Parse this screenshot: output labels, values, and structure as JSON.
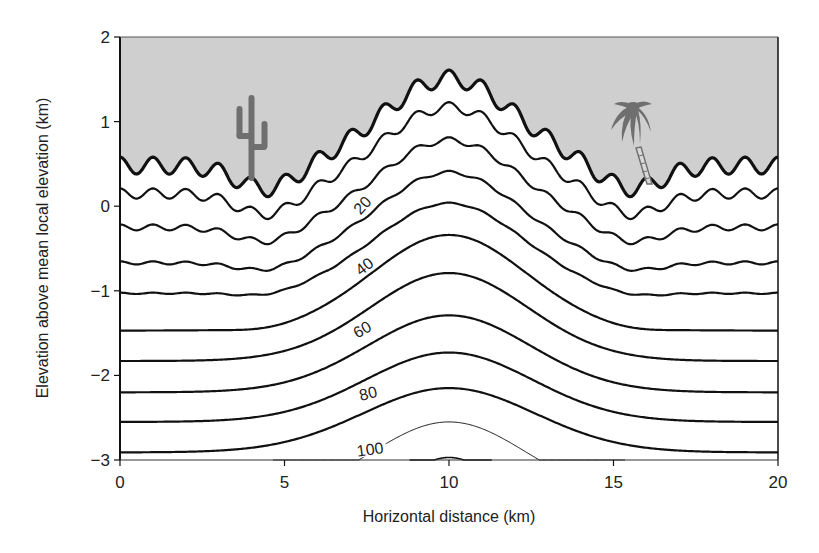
{
  "chart_data": {
    "type": "line",
    "subtype": "contour-cross-section",
    "title": "",
    "xlabel": "Horizontal distance (km)",
    "ylabel": "Elevation above mean local elevation (km)",
    "xlim": [
      0,
      20
    ],
    "ylim": [
      -3,
      2
    ],
    "x_ticks": [
      0,
      5,
      10,
      15,
      20
    ],
    "y_ticks": [
      -3,
      -2,
      -1,
      0,
      1,
      2
    ],
    "grid": false,
    "legend": null,
    "sky_fill": "#cfcfcf",
    "surface": {
      "name": "Ground surface",
      "isotherm": 0,
      "left": 0.48,
      "center": 1.51,
      "sigma": 2.8,
      "dip": 0.29,
      "wave": 0.1,
      "x_range": [
        0,
        20
      ],
      "stroke_width": 3.2,
      "color": "#111111"
    },
    "isotherms": [
      {
        "value": 10,
        "left": 0.15,
        "center": 1.17,
        "sigma": 2.9,
        "dip": 0.27,
        "wave": 0.06,
        "x_range": [
          0,
          20
        ],
        "stroke_width": 2.2,
        "label": ""
      },
      {
        "value": 20,
        "left": -0.25,
        "center": 0.78,
        "sigma": 3.0,
        "dip": 0.2,
        "wave": 0.035,
        "x_range": [
          0,
          20
        ],
        "stroke_width": 2.2,
        "label": "20",
        "label_pos": [
          362,
          205
        ],
        "label_angle": -48
      },
      {
        "value": 30,
        "left": -0.67,
        "center": 0.4,
        "sigma": 3.1,
        "dip": 0.12,
        "wave": 0.018,
        "x_range": [
          0,
          20
        ],
        "stroke_width": 2.2,
        "label": ""
      },
      {
        "value": 40,
        "left": -1.03,
        "center": 0.035,
        "sigma": 3.2,
        "dip": 0.06,
        "wave": 0.008,
        "x_range": [
          0,
          20
        ],
        "stroke_width": 2.2,
        "label": "40",
        "label_pos": [
          364,
          266
        ],
        "label_angle": -38
      },
      {
        "value": 50,
        "left": -1.47,
        "center": -0.34,
        "sigma": 3.3,
        "dip": 0.03,
        "wave": 0.0,
        "x_range": [
          0,
          20
        ],
        "stroke_width": 2.2,
        "label": ""
      },
      {
        "value": 60,
        "left": -1.83,
        "center": -0.79,
        "sigma": 3.4,
        "dip": 0.0,
        "wave": 0.0,
        "x_range": [
          0,
          20
        ],
        "stroke_width": 2.2,
        "label": "60",
        "label_pos": [
          362,
          329
        ],
        "label_angle": -30
      },
      {
        "value": 70,
        "left": -2.2,
        "center": -1.29,
        "sigma": 3.5,
        "dip": 0.0,
        "wave": 0.0,
        "x_range": [
          0,
          20
        ],
        "stroke_width": 2.2,
        "label": ""
      },
      {
        "value": 80,
        "left": -2.55,
        "center": -1.73,
        "sigma": 3.6,
        "dip": 0.0,
        "wave": 0.0,
        "x_range": [
          0,
          20
        ],
        "stroke_width": 2.2,
        "label": "80",
        "label_pos": [
          368,
          393
        ],
        "label_angle": -14
      },
      {
        "value": 90,
        "left": -2.91,
        "center": -2.15,
        "sigma": 3.7,
        "dip": 0.0,
        "wave": 0.0,
        "x_range": [
          0,
          20
        ],
        "stroke_width": 2.2,
        "label": ""
      },
      {
        "value": 100,
        "left": -3.45,
        "center": -2.55,
        "sigma": 3.3,
        "dip": 0.0,
        "wave": 0.0,
        "x_range": [
          4.65,
          15.35
        ],
        "stroke_width": 1.0,
        "label": "100",
        "label_pos": [
          370,
          449
        ],
        "label_angle": -8
      },
      {
        "value": 110,
        "left": -3.2,
        "center": -2.97,
        "sigma": 1.2,
        "dip": 0.0,
        "wave": 0.0,
        "x_range": [
          8.8,
          11.3
        ],
        "stroke_width": 1.6,
        "label": ""
      }
    ],
    "annotations": [
      {
        "type": "icon",
        "name": "cactus",
        "x_km": 4.0
      },
      {
        "type": "icon",
        "name": "palm-tree",
        "x_km": 15.8
      }
    ]
  }
}
